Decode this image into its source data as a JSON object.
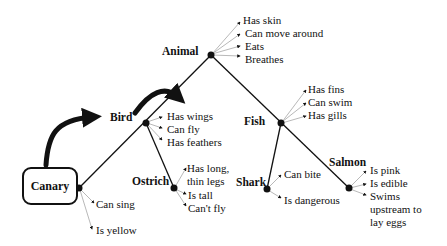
{
  "diagram": {
    "type": "semantic-network",
    "nodes": {
      "animal": {
        "label": "Animal",
        "properties": [
          "Has skin",
          "Can move around",
          "Eats",
          "Breathes"
        ]
      },
      "bird": {
        "label": "Bird",
        "properties": [
          "Has wings",
          "Can fly",
          "Has feathers"
        ]
      },
      "fish": {
        "label": "Fish",
        "properties": [
          "Has fins",
          "Can swim",
          "Has gills"
        ]
      },
      "canary": {
        "label": "Canary",
        "properties": [
          "Can sing",
          "Is yellow"
        ]
      },
      "ostrich": {
        "label": "Ostrich",
        "properties": [
          "Has long,",
          "thin legs",
          "Is tall",
          "Can't fly"
        ]
      },
      "shark": {
        "label": "Shark",
        "properties": [
          "Can bite",
          "Is dangerous"
        ]
      },
      "salmon": {
        "label": "Salmon",
        "properties": [
          "Is pink",
          "Is edible",
          "Swims",
          "upstream to",
          "lay eggs"
        ]
      }
    },
    "edges": [
      [
        "animal",
        "bird"
      ],
      [
        "animal",
        "fish"
      ],
      [
        "bird",
        "canary"
      ],
      [
        "bird",
        "ostrich"
      ],
      [
        "fish",
        "shark"
      ],
      [
        "fish",
        "salmon"
      ]
    ],
    "colors": {
      "line": "#111111",
      "property_line": "#9a9a9a",
      "background": "#ffffff"
    }
  }
}
